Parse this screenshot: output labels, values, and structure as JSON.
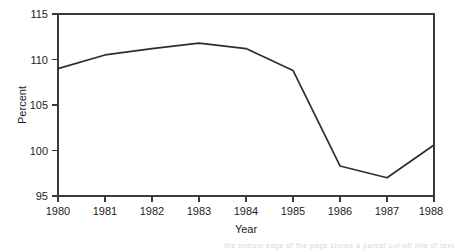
{
  "figure": {
    "width": 458,
    "height": 250,
    "background_color": "#ffffff",
    "line_color": "#2e2e2e",
    "axis_color": "#3a3a3a",
    "text_color": "#1c1c1c",
    "scan_artifact_text": "the bottom edge of the page shows a partial cut-off line of text"
  },
  "chart_data": {
    "type": "line",
    "title": "",
    "xlabel": "Year",
    "ylabel": "Percent",
    "categories": [
      "1980",
      "1981",
      "1982",
      "1983",
      "1984",
      "1985",
      "1986",
      "1987",
      "1988"
    ],
    "x": [
      1980,
      1981,
      1982,
      1983,
      1984,
      1985,
      1986,
      1987,
      1988
    ],
    "values": [
      109.0,
      110.5,
      111.2,
      111.8,
      111.2,
      108.8,
      98.3,
      97.0,
      100.6
    ],
    "series": [
      {
        "name": "Percent",
        "values": [
          109.0,
          110.5,
          111.2,
          111.8,
          111.2,
          108.8,
          98.3,
          97.0,
          100.6
        ]
      }
    ],
    "xlim": [
      1980,
      1988
    ],
    "ylim": [
      95,
      115
    ],
    "yticks": [
      95,
      100,
      105,
      110,
      115
    ],
    "ytick_labels": [
      "95",
      "100",
      "105",
      "110",
      "115"
    ],
    "xticks": [
      1980,
      1981,
      1982,
      1983,
      1984,
      1985,
      1986,
      1987,
      1988
    ],
    "xtick_labels": [
      "1980",
      "1981",
      "1982",
      "1983",
      "1984",
      "1985",
      "1986",
      "1987",
      "1988"
    ],
    "grid": false,
    "legend": false,
    "legend_position": "none",
    "tick_direction": "out",
    "spines": [
      "left",
      "bottom",
      "top",
      "right"
    ]
  },
  "plot_geometry": {
    "left": 58,
    "right": 434,
    "top": 14,
    "bottom": 196
  }
}
